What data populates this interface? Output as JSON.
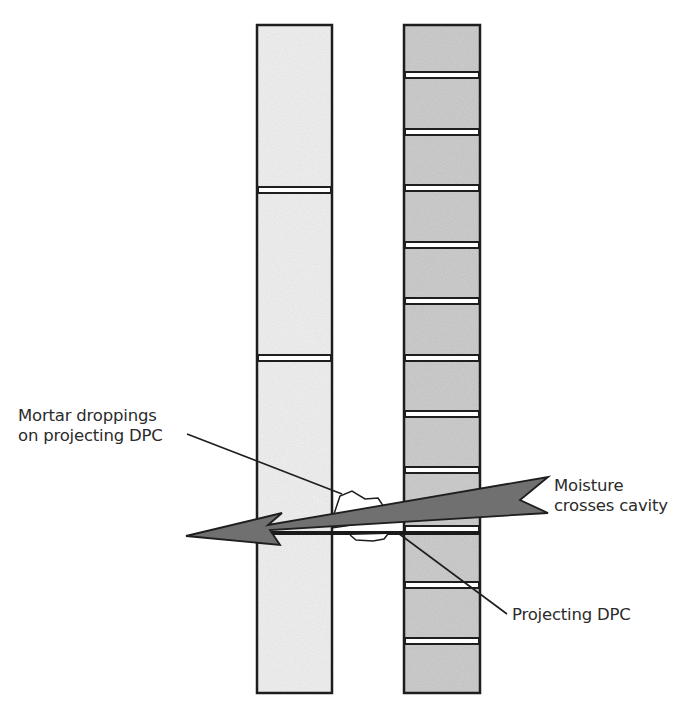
{
  "diagram": {
    "title_clipped": "Bridging of the wall cavity through mortar droppings",
    "labels": {
      "mortar_droppings_line1": "Mortar droppings",
      "mortar_droppings_line2": "on projecting DPC",
      "moisture_line1": "Moisture",
      "moisture_line2": "crosses cavity",
      "projecting_dpc": "Projecting DPC"
    },
    "colors": {
      "inner_leaf_fill": "#f3f3f3",
      "outer_leaf_fill": "#cfcfcf",
      "mortar_joint": "#ffffff",
      "outline": "#1e1e1e",
      "arrow_fill": "#707070",
      "dpc": "#1a1a1a"
    },
    "walls": {
      "inner_leaf": {
        "x": 257,
        "y": 25,
        "width": 75,
        "height": 668,
        "joints_y": [
          190,
          358
        ]
      },
      "outer_leaf": {
        "x": 404,
        "y": 25,
        "width": 76,
        "height": 668,
        "joints_y": [
          75,
          132,
          188,
          245,
          301,
          358,
          414,
          470,
          585,
          641
        ]
      }
    },
    "dpc": {
      "y": 532,
      "x_start": 257,
      "x_end": 480
    }
  }
}
